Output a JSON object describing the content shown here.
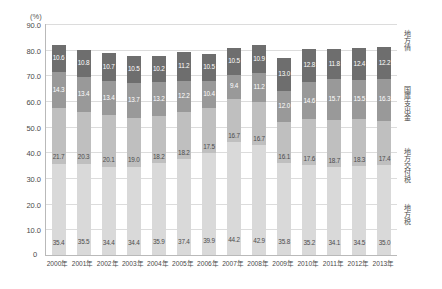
{
  "chart_data": {
    "type": "bar",
    "stacked": true,
    "title": "",
    "xlabel": "",
    "ylabel": "(%)",
    "ylim": [
      0,
      90
    ],
    "ytick_step": 10,
    "grid": true,
    "legend_position": "right",
    "categories": [
      "2000年",
      "2001年",
      "2002年",
      "2003年",
      "2004年",
      "2005年",
      "2006年",
      "2007年",
      "2008年",
      "2009年",
      "2010年",
      "2011年",
      "2012年",
      "2013年"
    ],
    "ytick_labels": [
      "90.0",
      "80.0",
      "70.0",
      "60.0",
      "50.0",
      "40.0",
      "30.0",
      "20.0",
      "10.0"
    ],
    "ytick_values": [
      90.0,
      80.0,
      70.0,
      60.0,
      50.0,
      40.0,
      30.0,
      20.0,
      10.0
    ],
    "zero_label": "0",
    "series": [
      {
        "name": "地方税",
        "color": "#d9d9d9",
        "label_color": "dark",
        "values": [
          35.4,
          35.5,
          34.4,
          34.4,
          35.9,
          37.4,
          39.9,
          44.2,
          42.9,
          35.8,
          35.2,
          34.1,
          34.5,
          35.0
        ],
        "labels": [
          "35.4",
          "35.5",
          "34.4",
          "34.4",
          "35.9",
          "37.4",
          "39.9",
          "44.2",
          "42.9",
          "35.8",
          "35.2",
          "34.1",
          "34.5",
          "35.0"
        ]
      },
      {
        "name": "地方交付税",
        "color": "#bfbfbf",
        "label_color": "dark",
        "values": [
          21.7,
          20.3,
          20.1,
          19.0,
          18.2,
          18.2,
          17.5,
          16.7,
          16.7,
          16.1,
          17.6,
          18.7,
          18.3,
          17.4
        ],
        "labels": [
          "21.7",
          "20.3",
          "20.1",
          "19.0",
          "18.2",
          "18.2",
          "17.5",
          "16.7",
          "16.7",
          "16.1",
          "17.6",
          "18.7",
          "18.3",
          "17.4"
        ]
      },
      {
        "name": "国庫支出金",
        "color": "#999999",
        "label_color": "light",
        "values": [
          14.3,
          13.4,
          13.4,
          13.7,
          13.2,
          12.2,
          10.4,
          9.4,
          11.2,
          12.0,
          14.6,
          15.7,
          15.5,
          16.3
        ],
        "labels": [
          "14.3",
          "13.4",
          "13.4",
          "13.7",
          "13.2",
          "12.2",
          "10.4",
          "9.4",
          "11.2",
          "12.0",
          "14.6",
          "15.7",
          "15.5",
          "16.3"
        ]
      },
      {
        "name": "地方債",
        "color": "#6e6e6e",
        "label_color": "light",
        "values": [
          10.6,
          10.8,
          10.7,
          10.5,
          10.2,
          11.2,
          10.5,
          10.5,
          10.9,
          13.0,
          12.8,
          11.8,
          12.4,
          12.2
        ],
        "labels": [
          "10.6",
          "10.8",
          "10.7",
          "10.5",
          "10.2",
          "11.2",
          "10.5",
          "10.5",
          "10.9",
          "13.0",
          "12.8",
          "11.8",
          "12.4",
          "12.2"
        ]
      }
    ]
  }
}
